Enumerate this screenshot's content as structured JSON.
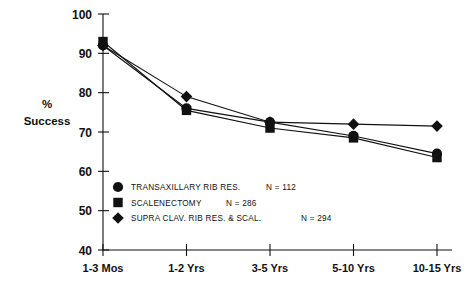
{
  "chart_data": {
    "type": "line",
    "title": "",
    "subtitle": "",
    "xlabel": "",
    "ylabel": "% Success",
    "ylabel_lines": [
      "%",
      "Success"
    ],
    "categories": [
      "1-3 Mos",
      "1-2 Yrs",
      "3-5 Yrs",
      "5-10 Yrs",
      "10-15 Yrs"
    ],
    "ylim": [
      40,
      100
    ],
    "yticks": [
      40,
      50,
      60,
      70,
      80,
      90,
      100
    ],
    "ytick_labels": [
      "40",
      "50",
      "60",
      "70",
      "80",
      "90",
      "100"
    ],
    "grid": false,
    "legend_position": "inside-lower-left",
    "series": [
      {
        "name": "TRANSAXILLARY RIB RES.",
        "n_label": "N = 112",
        "marker": "circle",
        "color": "#111111",
        "values": [
          92,
          76,
          72.5,
          69,
          64.5
        ]
      },
      {
        "name": "SCALENECTOMY",
        "n_label": "N = 286",
        "marker": "square",
        "color": "#111111",
        "values": [
          93,
          75.5,
          71,
          68.5,
          63.5
        ]
      },
      {
        "name": "SUPRA CLAV. RIB RES. & SCAL.",
        "n_label": "N = 294",
        "marker": "diamond",
        "color": "#111111",
        "values": [
          92,
          79,
          72.5,
          72,
          71.5
        ]
      }
    ]
  },
  "legend": {
    "items": [
      {
        "marker": "circle-marker",
        "label": "TRANSAXILLARY RIB RES.",
        "n": "N = 112"
      },
      {
        "marker": "square-marker",
        "label": "SCALENECTOMY",
        "n": "N = 286"
      },
      {
        "marker": "diamond-marker",
        "label": "SUPRA CLAV. RIB RES. & SCAL.",
        "n": "N = 294"
      }
    ]
  },
  "axes": {
    "y_label_line1": "%",
    "y_label_line2": "Success",
    "y_ticks": [
      "100",
      "90",
      "80",
      "70",
      "60",
      "50",
      "40"
    ],
    "x_ticks": [
      "1-3 Mos",
      "1-2 Yrs",
      "3-5 Yrs",
      "5-10 Yrs",
      "10-15 Yrs"
    ]
  },
  "colors": {
    "ink": "#111111",
    "background": "#ffffff"
  }
}
